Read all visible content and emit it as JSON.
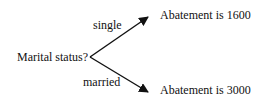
{
  "diagram": {
    "root": {
      "label": "Marital status?"
    },
    "branches": [
      {
        "edge_label": "single",
        "outcome": "Abatement is 1600"
      },
      {
        "edge_label": "married",
        "outcome": "Abatement is 3000"
      }
    ],
    "colors": {
      "text": "#111111",
      "line": "#111111",
      "background": "#ffffff"
    }
  }
}
